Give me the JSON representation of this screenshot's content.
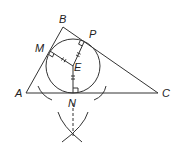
{
  "diagram": {
    "type": "geometry-construction",
    "points": {
      "A": {
        "label": "A",
        "x": 26,
        "y": 93
      },
      "B": {
        "label": "B",
        "x": 63,
        "y": 27
      },
      "C": {
        "label": "C",
        "x": 158,
        "y": 93
      },
      "M": {
        "label": "M",
        "x": 50,
        "y": 51
      },
      "P": {
        "label": "P",
        "x": 84,
        "y": 42
      },
      "E": {
        "label": "E",
        "x": 73,
        "y": 66
      },
      "N": {
        "label": "N",
        "x": 73,
        "y": 93
      }
    },
    "circle": {
      "center": "E",
      "radius": 27
    },
    "segments": [
      [
        "A",
        "B"
      ],
      [
        "B",
        "C"
      ],
      [
        "A",
        "C"
      ],
      [
        "E",
        "M"
      ],
      [
        "E",
        "P"
      ],
      [
        "E",
        "N"
      ]
    ],
    "right_angles": [
      "M",
      "P",
      "N"
    ],
    "tick_marks": [
      "EM",
      "EP",
      "EN"
    ],
    "construction": {
      "arc_intersection": {
        "x": 73,
        "y": 133
      },
      "dashed_line": [
        "N",
        "arc_intersection"
      ]
    },
    "colors": {
      "stroke": "#333333",
      "background": "#ffffff"
    }
  }
}
